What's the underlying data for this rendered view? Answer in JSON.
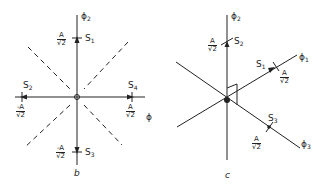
{
  "panel_b": {
    "caption": "b",
    "axes": {
      "vertical": "ϕ",
      "vertical_sub": "2",
      "horizontal": "ϕ"
    },
    "states": [
      {
        "name": "S",
        "sub": "1",
        "value_num": "A",
        "value_den": "√2"
      },
      {
        "name": "S",
        "sub": "2",
        "value_num": "-A",
        "value_den": "√2"
      },
      {
        "name": "S",
        "sub": "3",
        "value_num": "-A",
        "value_den": "√2"
      },
      {
        "name": "S",
        "sub": "4",
        "value_num": "A",
        "value_den": "√2"
      }
    ]
  },
  "panel_c": {
    "caption": "c",
    "axes": [
      {
        "label": "ϕ",
        "sub": "2"
      },
      {
        "label": "ϕ",
        "sub": "1"
      },
      {
        "label": "ϕ",
        "sub": "3"
      }
    ],
    "states": [
      {
        "name": "S",
        "sub": "2",
        "value_num": "A",
        "value_den": "√2"
      },
      {
        "name": "S",
        "sub": "1",
        "value_num": "A",
        "value_den": "√2"
      },
      {
        "name": "S",
        "sub": "3",
        "value_num": "A",
        "value_den": "√2"
      }
    ]
  }
}
